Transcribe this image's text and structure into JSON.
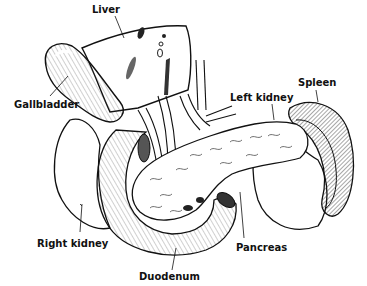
{
  "diagram": {
    "labels": {
      "liver": "Liver",
      "gallbladder": "Gallbladder",
      "left_kidney": "Left kidney",
      "spleen": "Spleen",
      "right_kidney": "Right kidney",
      "pancreas": "Pancreas",
      "duodenum": "Duodenum"
    },
    "colors": {
      "ink": "#111111",
      "paper": "#ffffff",
      "shade": "#d9d9d9"
    }
  }
}
